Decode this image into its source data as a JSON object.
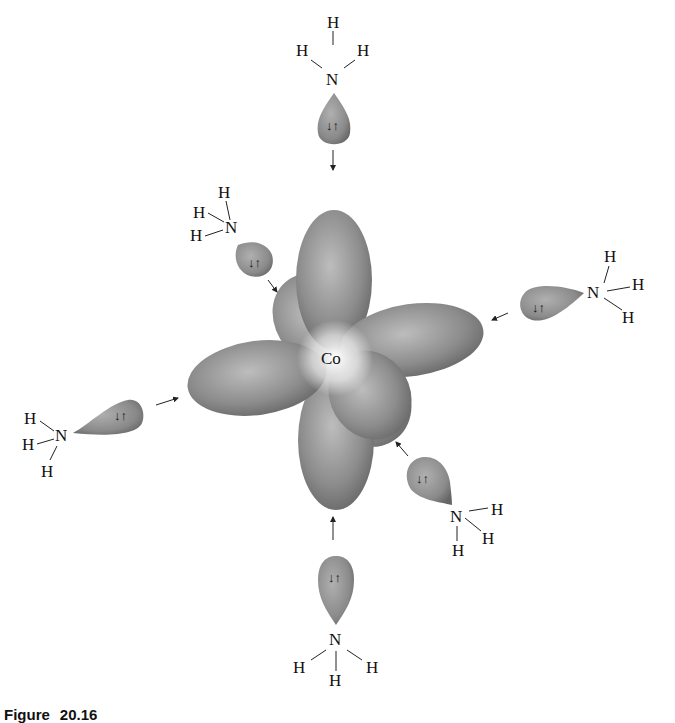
{
  "figure": {
    "caption_label": "Figure",
    "caption_number": "20.16",
    "center_atom": "Co",
    "ligands": [
      {
        "position": "top",
        "N": "N",
        "H": [
          "H",
          "H",
          "H"
        ],
        "electrons": "↓↑"
      },
      {
        "position": "upper-left",
        "N": "N",
        "H": [
          "H",
          "H",
          "H"
        ],
        "electrons": "↓↑"
      },
      {
        "position": "right",
        "N": "N",
        "H": [
          "H",
          "H",
          "H"
        ],
        "electrons": "↓↑"
      },
      {
        "position": "left",
        "N": "N",
        "H": [
          "H",
          "H",
          "H"
        ],
        "electrons": "↓↑"
      },
      {
        "position": "lower-right",
        "N": "N",
        "H": [
          "H",
          "H",
          "H"
        ],
        "electrons": "↓↑"
      },
      {
        "position": "bottom",
        "N": "N",
        "H": [
          "H",
          "H",
          "H"
        ],
        "electrons": "↓↑"
      }
    ],
    "colors": {
      "lobe_dark": "#6f6f6f",
      "lobe_light": "#d8d8d8",
      "text": "#111111"
    }
  }
}
